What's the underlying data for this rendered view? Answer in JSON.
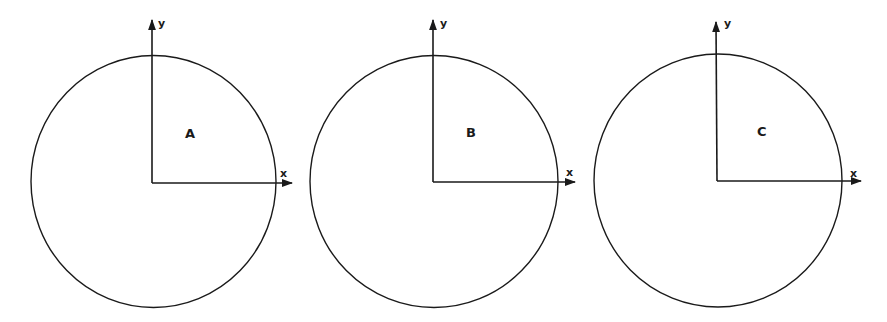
{
  "figure": {
    "stroke_color": "#1a1a1a",
    "background": "#ffffff",
    "panels": [
      {
        "id": "A",
        "label": "A",
        "x_axis_label": "x",
        "y_axis_label": "y"
      },
      {
        "id": "B",
        "label": "B",
        "x_axis_label": "x",
        "y_axis_label": "y"
      },
      {
        "id": "C",
        "label": "C",
        "x_axis_label": "x",
        "y_axis_label": "y"
      }
    ]
  }
}
